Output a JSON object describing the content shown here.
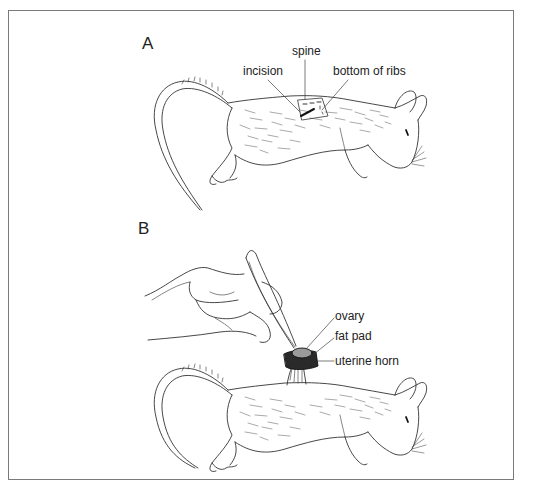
{
  "figure": {
    "panels": [
      {
        "letter": "A",
        "labels": {
          "spine": "spine",
          "incision": "incision",
          "bottom_of_ribs": "bottom of ribs"
        }
      },
      {
        "letter": "B",
        "labels": {
          "ovary": "ovary",
          "fat_pad": "fat pad",
          "uterine_horn": "uterine horn"
        }
      }
    ],
    "colors": {
      "line": "#333333",
      "frame": "#7a7a7a",
      "uterine_horn": "#2a2a2a",
      "ovary": "#9a9a9a"
    }
  }
}
